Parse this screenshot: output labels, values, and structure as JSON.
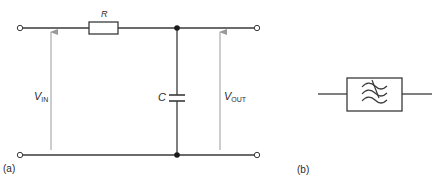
{
  "figure_a": {
    "label": "(a)",
    "resistor": {
      "label": "R"
    },
    "capacitor": {
      "label": "C"
    },
    "input_voltage": {
      "symbol": "V",
      "subscript": "IN"
    },
    "output_voltage": {
      "symbol": "V",
      "subscript": "OUT"
    }
  },
  "figure_b": {
    "label": "(b)",
    "filter_symbol": "low-pass-filter-icon"
  },
  "colors": {
    "wire": "#3a3a3a",
    "arrow": "#9a9a9a",
    "text": "#2a2a2a",
    "background": "#ffffff"
  }
}
